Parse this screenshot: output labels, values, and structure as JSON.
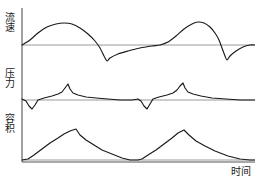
{
  "chart_data": {
    "type": "line",
    "title": "",
    "subtitle": "",
    "xlabel": "时间",
    "ylabel": "",
    "grid": false,
    "legend": null,
    "panels": [
      {
        "name": "flow",
        "ylabel": "流速",
        "baseline_label": "0",
        "baseline_y": 45,
        "panel_top": 8,
        "panel_bottom": 68,
        "description": "双周期流速波形，吸气为正相圆顶峰，呼气为负相尖谷",
        "points": [
          [
            22,
            45
          ],
          [
            30,
            40
          ],
          [
            38,
            33
          ],
          [
            47,
            27
          ],
          [
            56,
            24
          ],
          [
            64,
            23
          ],
          [
            72,
            24
          ],
          [
            80,
            28
          ],
          [
            88,
            34
          ],
          [
            95,
            41
          ],
          [
            100,
            48
          ],
          [
            104,
            56
          ],
          [
            107,
            61
          ],
          [
            110,
            58
          ],
          [
            118,
            54
          ],
          [
            128,
            51
          ],
          [
            140,
            48
          ],
          [
            152,
            46
          ],
          [
            160,
            45
          ],
          [
            168,
            42
          ],
          [
            176,
            36
          ],
          [
            184,
            29
          ],
          [
            192,
            24
          ],
          [
            198,
            22
          ],
          [
            204,
            23
          ],
          [
            210,
            27
          ],
          [
            215,
            33
          ],
          [
            219,
            40
          ],
          [
            222,
            48
          ],
          [
            225,
            56
          ],
          [
            227,
            60
          ],
          [
            230,
            56
          ],
          [
            236,
            51
          ],
          [
            243,
            47
          ],
          [
            250,
            45
          ],
          [
            255,
            45
          ]
        ]
      },
      {
        "name": "pressure",
        "ylabel": "压力",
        "baseline_label": "0",
        "baseline_y": 100,
        "panel_top": 70,
        "panel_bottom": 115,
        "description": "双周期压力波形，起始小负向切迹后缓升至尖峰再回落至基线",
        "points": [
          [
            22,
            99
          ],
          [
            26,
            101
          ],
          [
            29,
            106
          ],
          [
            32,
            109
          ],
          [
            35,
            105
          ],
          [
            38,
            100
          ],
          [
            44,
            98
          ],
          [
            52,
            96
          ],
          [
            58,
            94
          ],
          [
            62,
            92
          ],
          [
            65,
            88
          ],
          [
            68,
            84
          ],
          [
            70,
            89
          ],
          [
            73,
            93
          ],
          [
            78,
            95
          ],
          [
            86,
            97
          ],
          [
            96,
            98
          ],
          [
            108,
            99
          ],
          [
            120,
            100
          ],
          [
            132,
            100
          ],
          [
            138,
            99
          ],
          [
            141,
            101
          ],
          [
            144,
            106
          ],
          [
            147,
            109
          ],
          [
            150,
            104
          ],
          [
            153,
            99
          ],
          [
            159,
            97
          ],
          [
            167,
            95
          ],
          [
            173,
            93
          ],
          [
            177,
            90
          ],
          [
            180,
            86
          ],
          [
            183,
            83
          ],
          [
            185,
            88
          ],
          [
            188,
            92
          ],
          [
            193,
            94
          ],
          [
            201,
            96
          ],
          [
            212,
            98
          ],
          [
            226,
            99
          ],
          [
            240,
            100
          ],
          [
            255,
            100
          ]
        ]
      },
      {
        "name": "volume",
        "ylabel": "容积",
        "baseline_label": "0",
        "baseline_y": 160,
        "panel_top": 118,
        "panel_bottom": 162,
        "description": "双周期容积波形，吸气线性上升至峰值后缓慢下降回零",
        "points": [
          [
            22,
            160
          ],
          [
            28,
            159
          ],
          [
            34,
            155
          ],
          [
            42,
            149
          ],
          [
            50,
            143
          ],
          [
            58,
            138
          ],
          [
            64,
            134
          ],
          [
            70,
            131
          ],
          [
            76,
            129
          ],
          [
            80,
            135
          ],
          [
            86,
            140
          ],
          [
            94,
            145
          ],
          [
            102,
            150
          ],
          [
            112,
            154
          ],
          [
            122,
            158
          ],
          [
            130,
            160
          ],
          [
            138,
            160
          ],
          [
            142,
            159
          ],
          [
            148,
            155
          ],
          [
            156,
            150
          ],
          [
            164,
            144
          ],
          [
            172,
            138
          ],
          [
            178,
            133
          ],
          [
            184,
            130
          ],
          [
            189,
            135
          ],
          [
            196,
            141
          ],
          [
            205,
            146
          ],
          [
            215,
            151
          ],
          [
            228,
            156
          ],
          [
            240,
            159
          ],
          [
            250,
            160
          ],
          [
            255,
            160
          ]
        ]
      }
    ],
    "axis": {
      "y_axis_x": 22,
      "y_axis_top": 8,
      "y_axis_bottom": 162,
      "x_axis_y": 162,
      "x_axis_left": 22,
      "x_axis_right": 255
    },
    "colors": {
      "trace": "#1a1a1a",
      "baseline": "#9a9a9a",
      "axis": "#555555",
      "background": "#ffffff",
      "text": "#1a1a1a"
    }
  },
  "labels": {
    "flow": "流速",
    "pressure": "压力",
    "volume": "容积",
    "time": "时间"
  }
}
